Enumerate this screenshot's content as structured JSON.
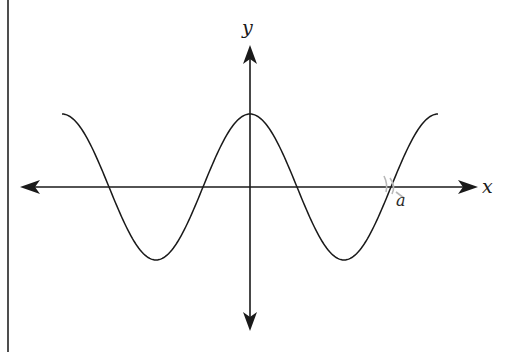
{
  "figure": {
    "x_axis_label": "x",
    "y_axis_label": "y",
    "point_label": "a",
    "colors": {
      "stroke": "#1a1a1a",
      "background": "#ffffff",
      "smudge": "#b8b8b8"
    }
  },
  "chart_data": {
    "type": "line",
    "title": "",
    "xlabel": "x",
    "ylabel": "y",
    "function": "y = cos(x)",
    "x_range": [
      -6.283,
      6.283
    ],
    "y_range": [
      -1,
      1
    ],
    "grid": false,
    "legend": "none",
    "annotations": [
      {
        "text": "a",
        "x": 4.712,
        "y": 0,
        "note": "marks the zero crossing at x = 3π/2"
      }
    ],
    "key_points": {
      "maxima": [
        [
          -6.283,
          1
        ],
        [
          0,
          1
        ],
        [
          6.283,
          1
        ]
      ],
      "minima": [
        [
          -3.1416,
          -1
        ],
        [
          3.1416,
          -1
        ]
      ],
      "zeros": [
        -4.712,
        -1.5708,
        1.5708,
        4.712
      ]
    }
  }
}
